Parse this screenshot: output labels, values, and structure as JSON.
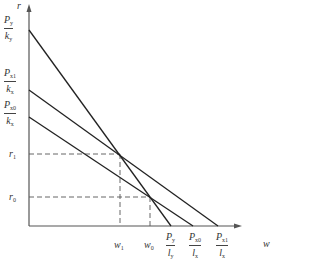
{
  "diagram": {
    "axes": {
      "x_label": "w",
      "y_label": "r",
      "origin": [
        29,
        226
      ],
      "x_end": 240,
      "y_top": 5,
      "color": "#555555"
    },
    "lines": [
      {
        "name": "Py-line",
        "from": [
          29,
          30
        ],
        "to": [
          171,
          226
        ]
      },
      {
        "name": "Px1-line",
        "from": [
          29,
          90
        ],
        "to": [
          218,
          226
        ]
      },
      {
        "name": "Px0-line",
        "from": [
          29,
          117
        ],
        "to": [
          193,
          226
        ]
      }
    ],
    "dashed": {
      "r1_y": 154,
      "w1_x": 120,
      "r0_y": 197,
      "w0_x": 150
    },
    "y_labels": [
      {
        "id": "py_ky",
        "num": "P",
        "num_sub": "y",
        "den": "k",
        "den_sub": "y",
        "x": 4,
        "y": 16
      },
      {
        "id": "px1_kx",
        "num": "P",
        "num_sub": "x1",
        "den": "k",
        "den_sub": "x",
        "x": 4,
        "y": 68
      },
      {
        "id": "px0_kx",
        "num": "P",
        "num_sub": "x0",
        "den": "k",
        "den_sub": "x",
        "x": 4,
        "y": 100
      },
      {
        "id": "r1",
        "text": "r",
        "sub": "1",
        "x": 9,
        "y": 149
      },
      {
        "id": "r0",
        "text": "r",
        "sub": "0",
        "x": 9,
        "y": 192
      }
    ],
    "x_labels": [
      {
        "id": "w1",
        "text": "w",
        "sub": "1",
        "x": 115,
        "y": 240
      },
      {
        "id": "w0",
        "text": "w",
        "sub": "0",
        "x": 145,
        "y": 240
      },
      {
        "id": "py_ly",
        "num": "P",
        "num_sub": "y",
        "den": "l",
        "den_sub": "y",
        "x": 166,
        "y": 230
      },
      {
        "id": "px0_lx",
        "num": "P",
        "num_sub": "x0",
        "den": "l",
        "den_sub": "x",
        "x": 190,
        "y": 230
      },
      {
        "id": "px1_lx",
        "num": "P",
        "num_sub": "x1",
        "den": "l",
        "den_sub": "x",
        "x": 217,
        "y": 230
      }
    ]
  }
}
